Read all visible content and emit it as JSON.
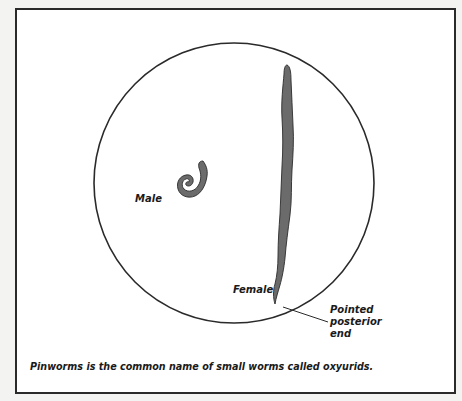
{
  "figure": {
    "labels": {
      "male": "Male",
      "female": "Female",
      "posterior": "Pointed\nposterior\nend"
    },
    "caption": "Pinworms is the common name of small worms called oxyurids.",
    "colors": {
      "worm_fill": "#6b6b6b",
      "worm_outline": "#2b2b2b",
      "circle_stroke": "#2a2a2a",
      "frame_stroke": "#2a2a2a",
      "background": "#ffffff"
    }
  }
}
